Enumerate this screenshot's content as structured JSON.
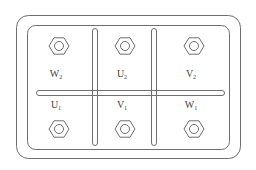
{
  "diagram": {
    "type": "terminal-box",
    "line_color": "#6e6e6e",
    "text_color": "#444444",
    "terminals": [
      {
        "id": "W2",
        "letter": "W",
        "index": "2",
        "row": "top",
        "col": 0
      },
      {
        "id": "U2",
        "letter": "U",
        "index": "2",
        "row": "top",
        "col": 1
      },
      {
        "id": "V2",
        "letter": "V",
        "index": "2",
        "row": "top",
        "col": 2
      },
      {
        "id": "U1",
        "letter": "U",
        "index": "1",
        "row": "bottom",
        "col": 0
      },
      {
        "id": "V1",
        "letter": "V",
        "index": "1",
        "row": "bottom",
        "col": 1
      },
      {
        "id": "W1",
        "letter": "W",
        "index": "1",
        "row": "bottom",
        "col": 2
      }
    ]
  }
}
